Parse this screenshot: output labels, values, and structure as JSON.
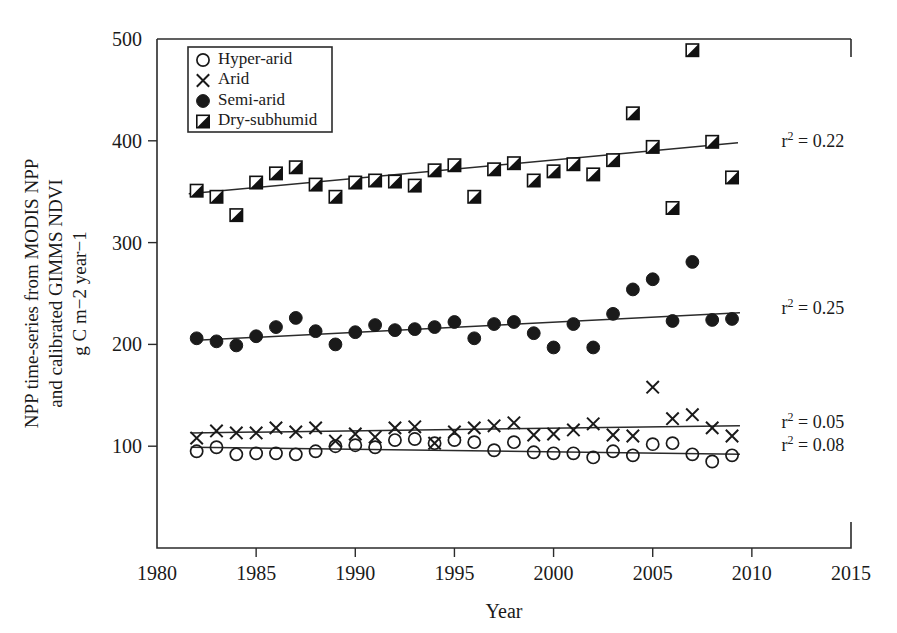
{
  "figure": {
    "background": "#ffffff",
    "ink_color": "#1a1a1a",
    "axis_title_x": "Year",
    "axis_title_y_line1": "NPP time-series from MODIS NPP",
    "axis_title_y_line2": "and calibrated GIMMS NDVI",
    "axis_title_y_line3": "g C m−2 year−1"
  },
  "legend": {
    "position": "top-left-inside",
    "entries": [
      {
        "label": "Hyper-arid",
        "marker": "open-circle-icon"
      },
      {
        "label": "Arid",
        "marker": "cross-icon"
      },
      {
        "label": "Semi-arid",
        "marker": "filled-circle-icon"
      },
      {
        "label": "Dry-subhumid",
        "marker": "half-filled-square-icon"
      }
    ]
  },
  "annotations": [
    {
      "name": "r2-dry-subhumid",
      "text": "r² = 0.22",
      "x": 2011.5,
      "y": 400
    },
    {
      "name": "r2-semi-arid",
      "text": "r² = 0.25",
      "x": 2011.5,
      "y": 236
    },
    {
      "name": "r2-arid",
      "text": "r² = 0.05",
      "x": 2011.5,
      "y": 124
    },
    {
      "name": "r2-hyper-arid",
      "text": "r² = 0.08",
      "x": 2011.5,
      "y": 101
    }
  ],
  "chart_data": {
    "type": "scatter",
    "title": "",
    "xlabel": "Year",
    "ylabel": "NPP time-series from MODIS NPP and calibrated GIMMS NDVI g C m-2 year-1",
    "xlim": [
      1980,
      2015
    ],
    "ylim": [
      0,
      500
    ],
    "xticks": [
      1980,
      1985,
      1990,
      1995,
      2000,
      2005,
      2010,
      2015
    ],
    "yticks": [
      100,
      200,
      300,
      400,
      500
    ],
    "grid": false,
    "legend_position": "upper left",
    "series": [
      {
        "name": "Dry-subhumid",
        "marker": "half-filled-square-icon",
        "r2": 0.22,
        "trend": {
          "x0": 1981.6,
          "y0": 348,
          "x1": 2009.3,
          "y1": 398
        },
        "x": [
          1982,
          1983,
          1984,
          1985,
          1986,
          1987,
          1988,
          1989,
          1990,
          1991,
          1992,
          1993,
          1994,
          1995,
          1996,
          1997,
          1998,
          1999,
          2000,
          2001,
          2002,
          2003,
          2004,
          2005,
          2006,
          2007,
          2008,
          2009
        ],
        "y": [
          351,
          345,
          327,
          359,
          368,
          374,
          357,
          345,
          359,
          361,
          360,
          356,
          371,
          376,
          345,
          372,
          378,
          361,
          370,
          377,
          367,
          381,
          427,
          394,
          334,
          489,
          399,
          364
        ]
      },
      {
        "name": "Semi-arid",
        "marker": "filled-circle-icon",
        "r2": 0.25,
        "trend": {
          "x0": 1982.0,
          "y0": 204,
          "x1": 2009.4,
          "y1": 231
        },
        "x": [
          1982,
          1983,
          1984,
          1985,
          1986,
          1987,
          1988,
          1989,
          1990,
          1991,
          1992,
          1993,
          1994,
          1995,
          1996,
          1997,
          1998,
          1999,
          2000,
          2001,
          2002,
          2003,
          2004,
          2005,
          2006,
          2007,
          2008,
          2009
        ],
        "y": [
          206,
          203,
          199,
          208,
          217,
          226,
          213,
          200,
          212,
          219,
          214,
          215,
          217,
          222,
          206,
          220,
          222,
          211,
          197,
          220,
          197,
          230,
          254,
          264,
          223,
          281,
          224,
          225
        ]
      },
      {
        "name": "Arid",
        "marker": "cross-icon",
        "r2": 0.05,
        "trend": {
          "x0": 1981.7,
          "y0": 113,
          "x1": 2009.4,
          "y1": 120
        },
        "x": [
          1982,
          1983,
          1984,
          1985,
          1986,
          1987,
          1988,
          1989,
          1990,
          1991,
          1992,
          1993,
          1994,
          1995,
          1996,
          1997,
          1998,
          1999,
          2000,
          2001,
          2002,
          2003,
          2004,
          2005,
          2006,
          2007,
          2008,
          2009
        ],
        "y": [
          108,
          115,
          113,
          113,
          118,
          114,
          118,
          105,
          112,
          109,
          118,
          119,
          103,
          114,
          118,
          120,
          123,
          111,
          112,
          116,
          122,
          111,
          110,
          158,
          127,
          131,
          118,
          110
        ]
      },
      {
        "name": "Hyper-arid",
        "marker": "open-circle-icon",
        "r2": 0.08,
        "trend": {
          "x0": 1981.7,
          "y0": 99,
          "x1": 2009.4,
          "y1": 92
        },
        "x": [
          1982,
          1983,
          1984,
          1985,
          1986,
          1987,
          1988,
          1989,
          1990,
          1991,
          1992,
          1993,
          1994,
          1995,
          1996,
          1997,
          1998,
          1999,
          2000,
          2001,
          2002,
          2003,
          2004,
          2005,
          2006,
          2007,
          2008,
          2009
        ],
        "y": [
          95,
          99,
          92,
          93,
          93,
          92,
          95,
          100,
          101,
          99,
          106,
          107,
          103,
          106,
          104,
          96,
          104,
          94,
          93,
          93,
          89,
          95,
          91,
          102,
          103,
          92,
          85,
          91
        ]
      }
    ]
  }
}
